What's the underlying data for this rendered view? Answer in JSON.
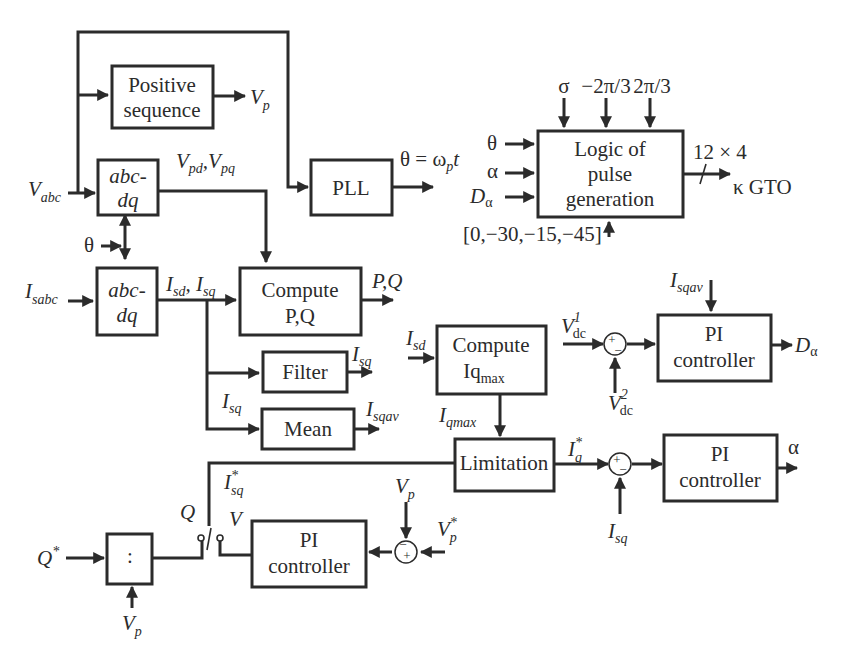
{
  "blocks": {
    "positive_sequence": {
      "line1": "Positive",
      "line2": "sequence"
    },
    "abcdq_v": {
      "line1": "abc-",
      "line2": "dq"
    },
    "abcdq_i": {
      "line1": "abc-",
      "line2": "dq"
    },
    "pll": {
      "label": "PLL"
    },
    "logic": {
      "line1": "Logic of",
      "line2": "pulse",
      "line3": "generation"
    },
    "compute_pq": {
      "line1": "Compute",
      "line2": "P,Q"
    },
    "filter": {
      "label": "Filter"
    },
    "mean": {
      "label": "Mean"
    },
    "compute_iqmax": {
      "line1": "Compute",
      "line2": "Iq",
      "line2_sub": "max"
    },
    "limitation": {
      "label": "Limitation"
    },
    "pi_dc": {
      "line1": "PI",
      "line2": "controller"
    },
    "pi_alpha": {
      "line1": "PI",
      "line2": "controller"
    },
    "pi_v": {
      "line1": "PI",
      "line2": "controller"
    },
    "divider": {
      "label": ":"
    }
  },
  "signals": {
    "vp_out": {
      "main": "V",
      "sub": "p"
    },
    "vabc": {
      "main": "V",
      "sub": "abc"
    },
    "vpd_vpq": {
      "a": "V",
      "a_sub": "pd",
      "sep": ",",
      "b": "V",
      "b_sub": "pq"
    },
    "theta_pll": {
      "text": "θ = ω",
      "sub": "p",
      "tail": "t"
    },
    "theta_in": "θ",
    "isabc": {
      "main": "I",
      "sub": "sabc"
    },
    "isd_isq": {
      "a": "I",
      "a_sub": "sd",
      "sep": ", ",
      "b": "I",
      "b_sub": "sq"
    },
    "pq_out": "P,Q",
    "isq_filter": {
      "main": "I",
      "sub": "sq"
    },
    "isq_branch": {
      "main": "I",
      "sub": "sq"
    },
    "isqav_out": {
      "main": "I",
      "sub": "sqav"
    },
    "isd_in": {
      "main": "I",
      "sub": "sd"
    },
    "iqmax": {
      "main": "I",
      "sub": "qmax"
    },
    "iq_star": {
      "main": "I",
      "sup": "*",
      "sub": "q"
    },
    "isq_star": {
      "main": "I",
      "sup": "*",
      "sub": "sq"
    },
    "vdc1": {
      "main": "V",
      "sub": "dc",
      "sup": "1"
    },
    "vdc2": {
      "main": "V",
      "sub": "dc",
      "sup": "2"
    },
    "isqav_in": {
      "main": "I",
      "sub": "sqav"
    },
    "d_alpha_out": {
      "main": "D",
      "sub": "α"
    },
    "alpha_out": "α",
    "isq_fb": {
      "main": "I",
      "sub": "sq"
    },
    "q_switch": "Q",
    "v_switch": "V",
    "vp_fb": {
      "main": "V",
      "sub": "p"
    },
    "vp_star": {
      "main": "V",
      "sup": "*",
      "sub": "p"
    },
    "q_star": {
      "main": "Q",
      "sup": "*"
    },
    "vp_div": {
      "main": "V",
      "sub": "p"
    },
    "logic_top": [
      "σ",
      "−2π/3",
      "2π/3"
    ],
    "logic_left": [
      "θ",
      "α"
    ],
    "logic_d_alpha": {
      "main": "D",
      "sub": "α"
    },
    "logic_bottom": "[0,−30,−15,−45]",
    "logic_out_count": "12 × 4",
    "logic_out_name": "κ GTO"
  },
  "summing": {
    "dc": {
      "top": "+",
      "bottom": "−"
    },
    "alpha": {
      "top": "+",
      "bottom": "−"
    },
    "v": {
      "top": "−",
      "bottom": "+"
    }
  }
}
